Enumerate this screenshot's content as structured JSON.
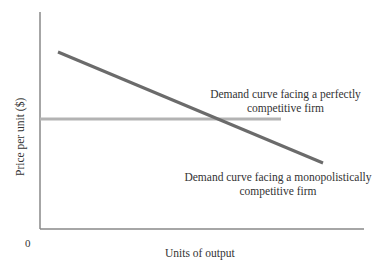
{
  "diagram": {
    "type": "economics-demand-curves",
    "axes": {
      "y_label": "Price per unit ($)",
      "x_label": "Units of output",
      "origin_label": "0"
    },
    "curves": [
      {
        "name": "monopolistic",
        "label_line1": "Demand curve facing a monopolistically",
        "label_line2": "competitive firm",
        "color": "#6b6b6b",
        "shape": "downward-sloping line"
      },
      {
        "name": "perfect",
        "label_line1": "Demand curve facing a perfectly",
        "label_line2": "competitive firm",
        "color": "#b3b3b3",
        "shape": "horizontal line"
      }
    ]
  },
  "colors": {
    "axis": "#888888",
    "text": "#333333",
    "steep_line": "#6b6b6b",
    "flat_line": "#b3b3b3"
  }
}
